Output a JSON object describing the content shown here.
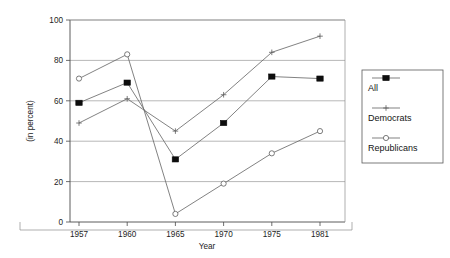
{
  "chart_data": {
    "type": "line",
    "title": "",
    "subtitle": "",
    "xlabel": "Year",
    "ylabel": "(in percent)",
    "categories": [
      "1957",
      "1960",
      "1965",
      "1970",
      "1975",
      "1981"
    ],
    "x": [
      1957,
      1960,
      1965,
      1970,
      1975,
      1981
    ],
    "ylim": [
      0,
      100
    ],
    "yticks": [
      0,
      20,
      40,
      60,
      80,
      100
    ],
    "ytick_labels": [
      "0",
      "20",
      "40",
      "60",
      "80",
      "100"
    ],
    "xtick_labels": [
      "1957",
      "1960",
      "1965",
      "1970",
      "1975",
      "1981"
    ],
    "grid": "horizontal",
    "legend_position": "right-outside",
    "series": [
      {
        "name": "All",
        "marker": "filled-square",
        "values": [
          59,
          69,
          31,
          49,
          72,
          71
        ]
      },
      {
        "name": "Democrats",
        "marker": "plus",
        "values": [
          49,
          61,
          45,
          63,
          84,
          92
        ]
      },
      {
        "name": "Republicans",
        "marker": "open-circle",
        "values": [
          71,
          83,
          4,
          19,
          34,
          45
        ]
      }
    ]
  },
  "axes": {
    "y_axis_title": "(in percent)",
    "x_axis_title": "Year"
  },
  "legend": {
    "entries": [
      {
        "label": "All",
        "marker": "filled-square"
      },
      {
        "label": "Democrats",
        "marker": "plus"
      },
      {
        "label": "Republicans",
        "marker": "open-circle"
      }
    ]
  },
  "colors": {
    "line": "#6b6b6b",
    "marker_fill": "#0d0d0d",
    "grid": "#9a9a9a",
    "axis": "#4a4a4a",
    "text": "#1a1a1a",
    "background": "#ffffff"
  }
}
